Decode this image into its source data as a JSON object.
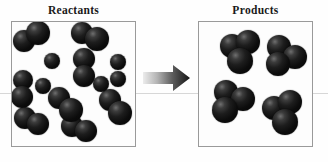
{
  "figure": {
    "caption_left": "Reactants",
    "caption_right": "Products",
    "arrow_label": "reaction-arrow",
    "background_color": "#ffffff",
    "box_border_color": "#9a9a9a",
    "atom_color": "#0d0d0d",
    "arrow_color_start": "#e2e2e2",
    "arrow_color_end": "#1b1b1b"
  },
  "layout": {
    "width": 328,
    "height": 162,
    "left_box": {
      "x": 11,
      "y": 21,
      "w": 125,
      "h": 126
    },
    "right_box": {
      "x": 198,
      "y": 21,
      "w": 115,
      "h": 126
    },
    "left_title": {
      "x": 11,
      "y": 4,
      "w": 125
    },
    "right_title": {
      "x": 198,
      "y": 4,
      "w": 115
    },
    "arrow": {
      "x": 143,
      "y": 64,
      "w": 48,
      "h": 28
    },
    "scanline_y": 93
  },
  "chart_data": {
    "type": "diagram",
    "subtype": "space-filling-molecular-model",
    "panels": [
      {
        "name": "reactants",
        "label": "Reactants",
        "molecule_count": 13,
        "molecules": [
          {
            "id": "r1",
            "kind": "diatomic",
            "atoms": 2,
            "spheres": [
              {
                "cx": 24,
                "cy": 41,
                "r": 11
              },
              {
                "cx": 38,
                "cy": 33,
                "r": 12
              }
            ]
          },
          {
            "id": "r2",
            "kind": "diatomic",
            "atoms": 2,
            "spheres": [
              {
                "cx": 82,
                "cy": 33,
                "r": 11
              },
              {
                "cx": 97,
                "cy": 39,
                "r": 12
              }
            ]
          },
          {
            "id": "r3",
            "kind": "monatomic",
            "atoms": 1,
            "spheres": [
              {
                "cx": 52,
                "cy": 61,
                "r": 8
              }
            ]
          },
          {
            "id": "r4",
            "kind": "diatomic",
            "atoms": 2,
            "spheres": [
              {
                "cx": 84,
                "cy": 59,
                "r": 11
              },
              {
                "cx": 84,
                "cy": 76,
                "r": 11
              }
            ]
          },
          {
            "id": "r5",
            "kind": "monatomic",
            "atoms": 1,
            "spheres": [
              {
                "cx": 118,
                "cy": 62,
                "r": 8
              }
            ]
          },
          {
            "id": "r6",
            "kind": "monatomic",
            "atoms": 1,
            "spheres": [
              {
                "cx": 118,
                "cy": 79,
                "r": 8
              }
            ]
          },
          {
            "id": "r7",
            "kind": "monatomic",
            "atoms": 1,
            "spheres": [
              {
                "cx": 43,
                "cy": 86,
                "r": 8
              }
            ]
          },
          {
            "id": "r8",
            "kind": "diatomic",
            "atoms": 2,
            "spheres": [
              {
                "cx": 23,
                "cy": 80,
                "r": 10
              },
              {
                "cx": 22,
                "cy": 97,
                "r": 11
              }
            ]
          },
          {
            "id": "r9",
            "kind": "diatomic",
            "atoms": 2,
            "spheres": [
              {
                "cx": 59,
                "cy": 98,
                "r": 11
              },
              {
                "cx": 71,
                "cy": 110,
                "r": 12
              }
            ]
          },
          {
            "id": "r10",
            "kind": "diatomic",
            "atoms": 2,
            "spheres": [
              {
                "cx": 110,
                "cy": 100,
                "r": 11
              },
              {
                "cx": 120,
                "cy": 113,
                "r": 12
              }
            ]
          },
          {
            "id": "r11",
            "kind": "diatomic",
            "atoms": 2,
            "spheres": [
              {
                "cx": 25,
                "cy": 118,
                "r": 11
              },
              {
                "cx": 38,
                "cy": 124,
                "r": 11
              }
            ]
          },
          {
            "id": "r12",
            "kind": "diatomic",
            "atoms": 2,
            "spheres": [
              {
                "cx": 72,
                "cy": 126,
                "r": 11
              },
              {
                "cx": 86,
                "cy": 131,
                "r": 11
              }
            ]
          },
          {
            "id": "r13",
            "kind": "monatomic",
            "atoms": 1,
            "spheres": [
              {
                "cx": 101,
                "cy": 84,
                "r": 8
              }
            ]
          }
        ]
      },
      {
        "name": "products",
        "label": "Products",
        "molecule_count": 4,
        "molecules": [
          {
            "id": "p1",
            "kind": "triatomic",
            "atoms": 3,
            "spheres": [
              {
                "cx": 232,
                "cy": 46,
                "r": 12
              },
              {
                "cx": 248,
                "cy": 42,
                "r": 12
              },
              {
                "cx": 240,
                "cy": 61,
                "r": 13
              }
            ]
          },
          {
            "id": "p2",
            "kind": "triatomic",
            "atoms": 3,
            "spheres": [
              {
                "cx": 279,
                "cy": 47,
                "r": 12
              },
              {
                "cx": 295,
                "cy": 57,
                "r": 12
              },
              {
                "cx": 278,
                "cy": 64,
                "r": 12
              }
            ]
          },
          {
            "id": "p3",
            "kind": "triatomic",
            "atoms": 3,
            "spheres": [
              {
                "cx": 226,
                "cy": 92,
                "r": 12
              },
              {
                "cx": 243,
                "cy": 99,
                "r": 12
              },
              {
                "cx": 225,
                "cy": 110,
                "r": 13
              }
            ]
          },
          {
            "id": "p4",
            "kind": "triatomic",
            "atoms": 3,
            "spheres": [
              {
                "cx": 274,
                "cy": 108,
                "r": 12
              },
              {
                "cx": 290,
                "cy": 102,
                "r": 12
              },
              {
                "cx": 285,
                "cy": 122,
                "r": 13
              }
            ]
          }
        ]
      }
    ]
  }
}
